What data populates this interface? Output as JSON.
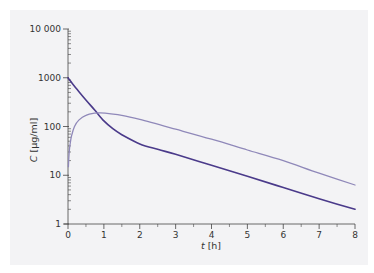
{
  "chart_data": {
    "type": "line",
    "title": "",
    "xlabel": "t [h]",
    "ylabel": "C [µg/ml]",
    "xlabel_var": "t",
    "xlabel_unit": " [h]",
    "ylabel_var": "C",
    "ylabel_unit": " [µg/ml]",
    "xlim": [
      0,
      8
    ],
    "ylim": [
      1,
      10000
    ],
    "yscale": "log",
    "grid": false,
    "legend": null,
    "x_ticks": [
      0,
      1,
      2,
      3,
      4,
      5,
      6,
      7,
      8
    ],
    "y_ticks": [
      1,
      10,
      100,
      1000,
      10000
    ],
    "y_tick_labels": [
      "1",
      "10",
      "100",
      "1000",
      "10 000"
    ],
    "series": [
      {
        "name": "dark-curve",
        "color": "#4a3a8a",
        "x": [
          0,
          0.1,
          0.25,
          0.5,
          0.75,
          1,
          1.25,
          1.5,
          2,
          2.5,
          3,
          4,
          5,
          6,
          7,
          8
        ],
        "values": [
          1000,
          800,
          580,
          350,
          215,
          130,
          90,
          68,
          44,
          34,
          27,
          16,
          9.5,
          5.6,
          3.3,
          2
        ]
      },
      {
        "name": "light-curve",
        "color": "#8f88b9",
        "x": [
          0.01,
          0.03,
          0.06,
          0.1,
          0.18,
          0.3,
          0.5,
          0.75,
          0.9,
          1.2,
          1.5,
          2,
          3,
          4,
          5,
          6,
          7,
          8
        ],
        "values": [
          15,
          28,
          45,
          65,
          100,
          135,
          170,
          188,
          190,
          182,
          170,
          140,
          88,
          55,
          33,
          20,
          11,
          6.3
        ]
      }
    ]
  },
  "colors": {
    "panel_background": "#f3f3f5",
    "axis": "#444444"
  }
}
